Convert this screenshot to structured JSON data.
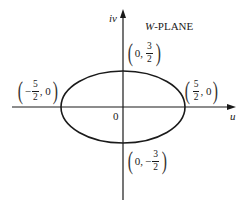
{
  "diagram": {
    "title": "W-PLANE",
    "title_prefix": "W",
    "title_suffix": "-PLANE",
    "axes": {
      "horizontal_label": "u",
      "vertical_label": "iv",
      "origin_label": "0"
    },
    "curve": {
      "type": "ellipse",
      "center": [
        0,
        0
      ],
      "semi_major_u": 2.5,
      "semi_minor_v": 1.5
    },
    "points": {
      "top": {
        "pre": "0,",
        "sign": "",
        "num": "3",
        "den": "2",
        "post": ""
      },
      "bottom": {
        "pre": "0,",
        "sign": "−",
        "num": "3",
        "den": "2",
        "post": ""
      },
      "left": {
        "pre": "",
        "sign": "−",
        "num": "5",
        "den": "2",
        "post": ", 0"
      },
      "right": {
        "pre": "",
        "sign": "",
        "num": "5",
        "den": "2",
        "post": ", 0"
      }
    },
    "colors": {
      "stroke": "#1a1a1a",
      "background": "#ffffff"
    }
  }
}
